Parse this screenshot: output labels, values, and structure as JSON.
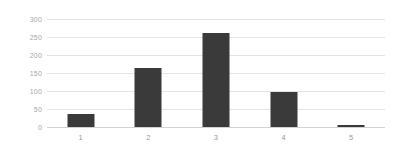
{
  "chart_data": {
    "type": "bar",
    "title": "",
    "subtitle": "",
    "xlabel": "",
    "ylabel": "",
    "categories": [
      "1",
      "2",
      "3",
      "4",
      "5"
    ],
    "values": [
      36,
      165,
      262,
      98,
      5
    ],
    "series": [
      {
        "name": "",
        "values": [
          36,
          165,
          262,
          98,
          5
        ]
      }
    ],
    "ylim": [
      0,
      300
    ],
    "yticks": [
      0,
      50,
      100,
      150,
      200,
      250,
      300
    ],
    "ytick_labels": [
      "0",
      "50",
      "100",
      "150",
      "200",
      "250",
      "300"
    ],
    "xtick_labels": [
      "1",
      "2",
      "3",
      "4",
      "5"
    ],
    "grid": "horizontal",
    "legend": "none",
    "annotations": [],
    "colors": {
      "bar": "#3a3a3a",
      "gridline": "#e4e4e4",
      "baseline": "#d2d2d2",
      "tick_text": "#9a9a9a",
      "background": "#ffffff"
    }
  }
}
